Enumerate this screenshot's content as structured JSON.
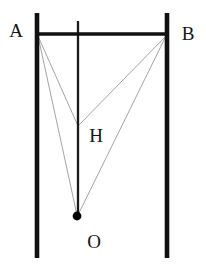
{
  "figure": {
    "canvas": {
      "width": 206,
      "height": 266,
      "background": "#ffffff"
    },
    "colors": {
      "rail": "#111111",
      "beam": "#111111",
      "plumb_line": "#1a1a1a",
      "thin_line": "#9a9a9a",
      "mass_dot": "#000000",
      "label": "#151515"
    },
    "labels": [
      {
        "name": "A",
        "text": "A",
        "x": 16,
        "y": 37
      },
      {
        "name": "B",
        "text": "B",
        "x": 183,
        "y": 40
      },
      {
        "name": "H",
        "text": "H",
        "x": 90,
        "y": 142
      },
      {
        "name": "O",
        "text": "O",
        "x": 87,
        "y": 248
      }
    ],
    "points": [
      {
        "name": "A",
        "x": 37,
        "y": 34
      },
      {
        "name": "B",
        "x": 167,
        "y": 34
      },
      {
        "name": "H",
        "x": 78,
        "y": 126
      },
      {
        "name": "O",
        "x": 77,
        "y": 216
      }
    ],
    "rails": [
      {
        "name": "left-rail",
        "x": 37,
        "y1": 13,
        "y2": 258,
        "width": 4.6
      },
      {
        "name": "right-rail",
        "x": 167,
        "y1": 13,
        "y2": 258,
        "width": 4.6
      }
    ],
    "beam": {
      "name": "beam-AB",
      "x1": 36,
      "x2": 168,
      "y": 34,
      "width": 3.4
    },
    "plumb_line": {
      "name": "plumb-line",
      "x": 78,
      "y1": 21,
      "y2": 217,
      "width": 2.3
    },
    "thin_lines": [
      {
        "name": "line-A-H",
        "x1": 38,
        "y1": 36,
        "x2": 78,
        "y2": 126,
        "width": 0.9
      },
      {
        "name": "line-A-O",
        "x1": 38,
        "y1": 36,
        "x2": 77,
        "y2": 215,
        "width": 0.9
      },
      {
        "name": "line-B-H",
        "x1": 166,
        "y1": 36,
        "x2": 78,
        "y2": 126,
        "width": 0.9
      },
      {
        "name": "line-B-O",
        "x1": 166,
        "y1": 36,
        "x2": 78,
        "y2": 215,
        "width": 0.9
      }
    ],
    "mass_dot": {
      "name": "mass-dot-O",
      "cx": 77,
      "cy": 216,
      "r": 4.4
    }
  }
}
